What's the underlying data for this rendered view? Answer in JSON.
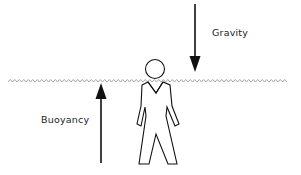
{
  "diagram": {
    "labels": {
      "gravity": "Gravity",
      "buoyancy": "Buoyancy"
    },
    "elements": {
      "water_surface": "wavy-line",
      "figure": "human-figure",
      "gravity_arrow": "down-arrow",
      "buoyancy_arrow": "up-arrow"
    },
    "colors": {
      "line": "#111111",
      "water": "#999999",
      "background": "#ffffff"
    }
  }
}
